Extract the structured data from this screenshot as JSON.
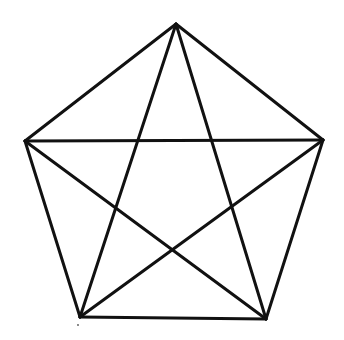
{
  "diagram": {
    "type": "pentagon-with-pentagram",
    "stroke_color": "#111111",
    "background_color": "#ffffff",
    "stroke_width": 3,
    "vertices": [
      {
        "id": "top",
        "x": 176,
        "y": 24
      },
      {
        "id": "right",
        "x": 323,
        "y": 140
      },
      {
        "id": "bottom-right",
        "x": 266,
        "y": 319
      },
      {
        "id": "bottom-left",
        "x": 80,
        "y": 317
      },
      {
        "id": "left",
        "x": 25,
        "y": 141
      }
    ],
    "pentagon_edges": [
      [
        "top",
        "right"
      ],
      [
        "right",
        "bottom-right"
      ],
      [
        "bottom-right",
        "bottom-left"
      ],
      [
        "bottom-left",
        "left"
      ],
      [
        "left",
        "top"
      ]
    ],
    "star_diagonals": [
      [
        "top",
        "bottom-left"
      ],
      [
        "top",
        "bottom-right"
      ],
      [
        "left",
        "right"
      ],
      [
        "left",
        "bottom-right"
      ],
      [
        "right",
        "bottom-left"
      ]
    ]
  }
}
